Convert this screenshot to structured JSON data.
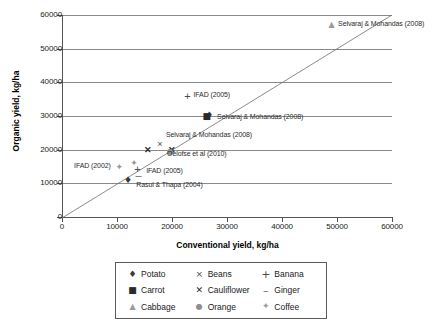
{
  "chart_data": {
    "type": "scatter",
    "title": "",
    "xlabel": "Conventional yield, kg/ha",
    "ylabel": "Organic yield, kg/ha",
    "xlim": [
      0,
      60000
    ],
    "ylim": [
      0,
      60000
    ],
    "xticks": [
      "0",
      "10000",
      "20000",
      "30000",
      "40000",
      "50000",
      "60000"
    ],
    "yticks": [
      "0",
      "10000",
      "20000",
      "30000",
      "40000",
      "50000",
      "60000"
    ],
    "grid": "horizontal",
    "legend_position": "below",
    "reference_line": {
      "type": "1:1 diagonal",
      "from": [
        0,
        0
      ],
      "to": [
        60000,
        60000
      ]
    },
    "series": [
      {
        "name": "Potato",
        "marker": "diamond",
        "points": [
          {
            "x": 12000,
            "y": 11000
          },
          {
            "x": 26800,
            "y": 30300
          }
        ]
      },
      {
        "name": "Carrot",
        "marker": "square",
        "points": [
          {
            "x": 26300,
            "y": 30000
          }
        ]
      },
      {
        "name": "Cabbage",
        "marker": "triangle",
        "points": [
          {
            "x": 49000,
            "y": 57000
          }
        ]
      },
      {
        "name": "Beans",
        "marker": "x",
        "points": [
          {
            "x": 17800,
            "y": 21700
          }
        ]
      },
      {
        "name": "Cauliflower",
        "marker": "x-bold",
        "points": [
          {
            "x": 15600,
            "y": 20000
          },
          {
            "x": 20000,
            "y": 20000
          }
        ]
      },
      {
        "name": "Orange",
        "marker": "circle",
        "points": [
          {
            "x": 19700,
            "y": 19300
          }
        ]
      },
      {
        "name": "Banana",
        "marker": "plus",
        "points": [
          {
            "x": 13700,
            "y": 14200
          },
          {
            "x": 22800,
            "y": 36000
          }
        ]
      },
      {
        "name": "Ginger",
        "marker": "dash",
        "points": [
          {
            "x": 13900,
            "y": 12500
          }
        ]
      },
      {
        "name": "Coffee",
        "marker": "coffee",
        "points": [
          {
            "x": 10400,
            "y": 15000
          },
          {
            "x": 13100,
            "y": 16100
          }
        ]
      }
    ],
    "annotations": [
      {
        "text": "Selvaraj & Mohandas (2008)",
        "x": 50200,
        "y": 57300
      },
      {
        "text": "IFAD (2005)",
        "x": 23900,
        "y": 36200
      },
      {
        "text": "Selvaraj & Mohandas (2008)",
        "x": 28200,
        "y": 29700
      },
      {
        "text": "Selvaraj & Mohandas (2008)",
        "x": 18900,
        "y": 24300
      },
      {
        "text": "Oelofse et al (2010)",
        "x": 19100,
        "y": 18600
      },
      {
        "text": "IFAD (2002)",
        "x": 2200,
        "y": 15200
      },
      {
        "text": "IFAD (2005)",
        "x": 15300,
        "y": 13700
      },
      {
        "text": "Rasul & Thapa (2004)",
        "x": 13500,
        "y": 9500
      }
    ]
  },
  "legend": {
    "items": [
      {
        "label": "Potato",
        "glyph": "♦",
        "marker_name": "diamond-marker"
      },
      {
        "label": "Beans",
        "glyph": "×",
        "marker_name": "x-marker"
      },
      {
        "label": "Banana",
        "glyph": "+",
        "marker_name": "plus-marker"
      },
      {
        "label": "Carrot",
        "glyph": "■",
        "marker_name": "square-marker"
      },
      {
        "label": "Cauliflower",
        "glyph": "✕",
        "marker_name": "x-bold-marker"
      },
      {
        "label": "Ginger",
        "glyph": "–",
        "marker_name": "dash-marker"
      },
      {
        "label": "Cabbage",
        "glyph": "▲",
        "marker_name": "triangle-marker"
      },
      {
        "label": "Orange",
        "glyph": "●",
        "marker_name": "circle-marker"
      },
      {
        "label": "Coffee",
        "glyph": "✦",
        "marker_name": "coffee-marker"
      }
    ]
  }
}
